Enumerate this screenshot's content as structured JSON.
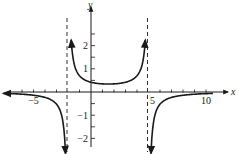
{
  "chart_data": {
    "type": "line",
    "title": "",
    "xlabel": "x",
    "ylabel": "y",
    "xlim": [
      -7.5,
      11
    ],
    "ylim": [
      -2.4,
      3.4
    ],
    "x_ticks": [
      -5,
      5,
      10
    ],
    "x_tick_labels": [
      "−5",
      "5",
      "10"
    ],
    "y_ticks": [
      -2,
      -1,
      1,
      2
    ],
    "y_tick_labels": [
      "−2",
      "−1",
      "1",
      "2"
    ],
    "minor_x_ticks": [
      -6,
      -5,
      -4,
      -3,
      -1,
      1,
      2,
      3,
      4,
      6,
      7,
      8,
      9,
      10
    ],
    "minor_y_ticks": [
      -2,
      -1.5,
      -1,
      -0.5,
      0.5,
      1,
      1.5,
      2,
      2.5
    ],
    "vertical_asymptotes": [
      -2,
      5
    ],
    "horizontal_asymptote": 0,
    "grid": false,
    "legend": null,
    "series": [
      {
        "name": "left-branch",
        "x": [
          -7.5,
          -6,
          -5,
          -4,
          -3,
          -2.5,
          -2.25
        ],
        "y": [
          0.07,
          0.14,
          0.19,
          0.31,
          0.6,
          1.3,
          2.7
        ]
      },
      {
        "name": "middle-branch",
        "x": [
          -1.7,
          -1.5,
          -1,
          0,
          1.5,
          3,
          4,
          4.5,
          4.7
        ],
        "y": [
          -1.9,
          -1.3,
          -0.75,
          -0.45,
          -0.38,
          -0.45,
          -0.75,
          -1.3,
          -1.9
        ]
      },
      {
        "name": "right-branch",
        "x": [
          5.25,
          5.5,
          6,
          7,
          8,
          10
        ],
        "y": [
          2.7,
          1.3,
          0.6,
          0.31,
          0.19,
          0.1
        ]
      }
    ]
  }
}
